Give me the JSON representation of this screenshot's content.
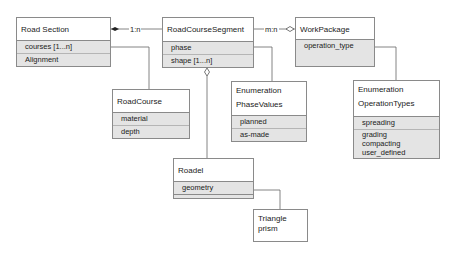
{
  "diagram": {
    "type": "UML class diagram",
    "classes": [
      {
        "id": "road_section",
        "name": "Road Section",
        "attributes": [
          "courses [1...n]",
          "Alignment"
        ]
      },
      {
        "id": "road_course_segment",
        "name": "RoadCourseSegment",
        "attributes": [
          "phase",
          "shape [1...n]"
        ]
      },
      {
        "id": "work_package",
        "name": "WorkPackage",
        "attributes": [
          "operation_type"
        ]
      },
      {
        "id": "road_course",
        "name": "RoadCourse",
        "attributes": [
          "material",
          "depth"
        ]
      },
      {
        "id": "phase_values",
        "name_lines": [
          "Enumeration",
          "PhaseValues"
        ],
        "attributes": [
          "planned",
          "as-made"
        ]
      },
      {
        "id": "operation_types",
        "name_lines": [
          "Enumeration",
          "OperationTypes"
        ],
        "attributes": [
          "spreading",
          "grading",
          "compacting",
          "user_defined"
        ]
      },
      {
        "id": "roadel",
        "name": "Roadel",
        "attributes": [
          "geometry"
        ]
      },
      {
        "id": "triangle_prism",
        "name_lines": [
          "Triangle",
          "prism"
        ],
        "attributes": []
      }
    ],
    "relations": [
      {
        "from": "road_section",
        "to": "road_course_segment",
        "label": "1:n",
        "end": "filled-diamond"
      },
      {
        "from": "road_course_segment",
        "to": "work_package",
        "label": "m:n",
        "end": "open-diamond"
      },
      {
        "from": "road_section.courses",
        "to": "road_course",
        "label": ""
      },
      {
        "from": "road_course_segment.phase",
        "to": "phase_values",
        "label": ""
      },
      {
        "from": "road_course_segment",
        "to": "roadel",
        "label": "",
        "end": "open-diamond"
      },
      {
        "from": "work_package.operation_type",
        "to": "operation_types",
        "label": ""
      },
      {
        "from": "roadel.geometry",
        "to": "triangle_prism",
        "label": ""
      }
    ]
  },
  "labels": {
    "rs_name": "Road Section",
    "rs_attr1": "courses [1...n]",
    "rs_attr2": "Alignment",
    "rcs_name": "RoadCourseSegment",
    "rcs_attr1": "phase",
    "rcs_attr2": "shape [1...n]",
    "wp_name": "WorkPackage",
    "wp_attr1": "operation_type",
    "rc_name": "RoadCourse",
    "rc_attr1": "material",
    "rc_attr2": "depth",
    "pv_line1": "Enumeration",
    "pv_line2": "PhaseValues",
    "pv_attr1": "planned",
    "pv_attr2": "as-made",
    "ot_line1": "Enumeration",
    "ot_line2": "OperationTypes",
    "ot_attr1": "spreading",
    "ot_attr2": "grading",
    "ot_attr3": "compacting",
    "ot_attr4": "user_defined",
    "roadel_name": "Roadel",
    "roadel_attr1": "geometry",
    "tp_line1": "Triangle",
    "tp_line2": "prism",
    "rel_1n": "1:n",
    "rel_mn": "m:n"
  }
}
